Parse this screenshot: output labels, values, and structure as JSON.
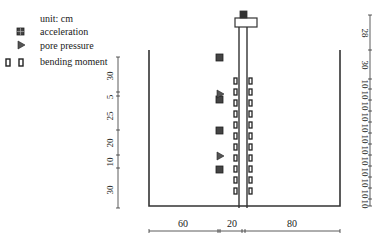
{
  "legend": {
    "unit": "unit: cm",
    "items": [
      {
        "icon": "acceleration-icon",
        "label": "acceleration"
      },
      {
        "icon": "pore-pressure-icon",
        "label": "pore pressure"
      },
      {
        "icon": "bending-moment-icon",
        "label": "bending moment"
      }
    ]
  },
  "left_dimensions": {
    "labels": [
      "30",
      "5",
      "25",
      "20",
      "10",
      "30"
    ]
  },
  "right_dimensions": {
    "labels": [
      "28",
      "30",
      "10",
      "10",
      "10",
      "10",
      "10",
      "10",
      "10",
      "10",
      "10",
      "10",
      "10",
      "10"
    ]
  },
  "bottom_dimensions": {
    "labels": [
      "60",
      "20",
      "80"
    ]
  },
  "colors": {
    "line": "#333333",
    "sensor": "#444444"
  }
}
